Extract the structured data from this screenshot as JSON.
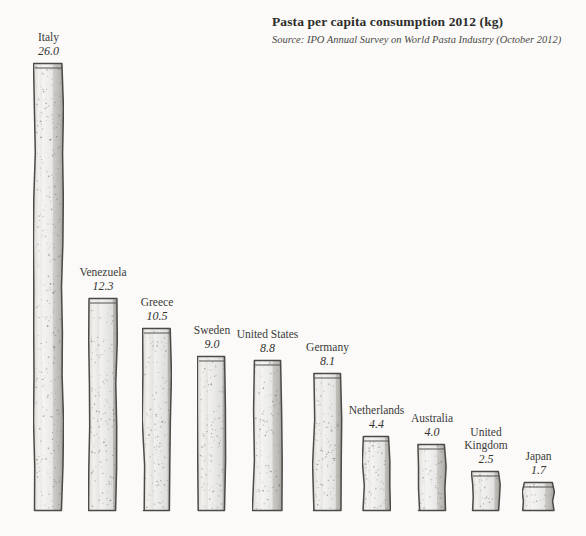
{
  "header": {
    "title": "Pasta per capita consumption 2012 (kg)",
    "source": "Source: IPO Annual Survey on World Pasta Industry (October 2012)"
  },
  "style": {
    "background": "#fbfaf8",
    "bar_fill_light": "#f2f1ee",
    "bar_fill_mid": "#d8d7d3",
    "bar_fill_dark": "#b9b8b3",
    "bar_outline": "#4a4a46",
    "text_color": "#3a3a38"
  },
  "chart_data": {
    "type": "bar",
    "title": "Pasta per capita consumption 2012 (kg)",
    "subtitle": "Source: IPO Annual Survey on World Pasta Industry (October 2012)",
    "xlabel": "",
    "ylabel": "kg per capita",
    "ylim": [
      0,
      26.0
    ],
    "grid": false,
    "legend": false,
    "units": "kg",
    "categories": [
      "Italy",
      "Venezuela",
      "Greece",
      "Sweden",
      "United States",
      "Germany",
      "Netherlands",
      "Australia",
      "United Kingdom",
      "Japan"
    ],
    "values": [
      26.0,
      12.3,
      10.5,
      9.0,
      8.8,
      8.1,
      4.4,
      4.0,
      2.5,
      1.7
    ],
    "value_labels": [
      "26.0",
      "12.3",
      "10.5",
      "9.0",
      "8.8",
      "8.1",
      "4.4",
      "4.0",
      "2.5",
      "1.7"
    ],
    "bars": [
      {
        "name": "Italy",
        "value": 26.0,
        "value_label": "26.0",
        "name_line1": "Italy",
        "name_line2": "",
        "x": 33,
        "width": 31,
        "top": 62,
        "height": 450
      },
      {
        "name": "Venezuela",
        "value": 12.3,
        "value_label": "12.3",
        "name_line1": "Venezuela",
        "name_line2": "",
        "x": 88,
        "width": 30,
        "top": 297,
        "height": 215
      },
      {
        "name": "Greece",
        "value": 10.5,
        "value_label": "10.5",
        "name_line1": "Greece",
        "name_line2": "",
        "x": 142,
        "width": 30,
        "top": 327,
        "height": 185
      },
      {
        "name": "Sweden",
        "value": 9.0,
        "value_label": "9.0",
        "name_line1": "Sweden",
        "name_line2": "",
        "x": 197,
        "width": 30,
        "top": 355,
        "height": 157
      },
      {
        "name": "United States",
        "value": 8.8,
        "value_label": "8.8",
        "name_line1": "United States",
        "name_line2": "",
        "x": 252,
        "width": 31,
        "top": 359,
        "height": 153
      },
      {
        "name": "Germany",
        "value": 8.1,
        "value_label": "8.1",
        "name_line1": "Germany",
        "name_line2": "",
        "x": 312,
        "width": 31,
        "top": 372,
        "height": 140
      },
      {
        "name": "Netherlands",
        "value": 4.4,
        "value_label": "4.4",
        "name_line1": "Netherlands",
        "name_line2": "",
        "x": 362,
        "width": 29,
        "top": 435,
        "height": 77
      },
      {
        "name": "Australia",
        "value": 4.0,
        "value_label": "4.0",
        "name_line1": "Australia",
        "name_line2": "",
        "x": 417,
        "width": 30,
        "top": 443,
        "height": 69
      },
      {
        "name": "United Kingdom",
        "value": 2.5,
        "value_label": "2.5",
        "name_line1": "United",
        "name_line2": "Kingdom",
        "x": 471,
        "width": 30,
        "top": 470,
        "height": 42
      },
      {
        "name": "Japan",
        "value": 1.7,
        "value_label": "1.7",
        "name_line1": "Japan",
        "name_line2": "",
        "x": 522,
        "width": 33,
        "top": 481,
        "height": 31
      }
    ]
  }
}
